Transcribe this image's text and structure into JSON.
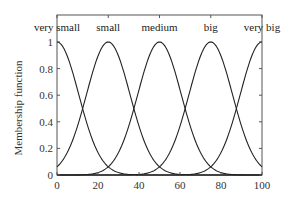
{
  "chart_data": {
    "type": "line",
    "title": "",
    "xlabel": "",
    "ylabel": "Membership function",
    "xlim": [
      0,
      100
    ],
    "ylim": [
      0,
      1.0
    ],
    "grid": false,
    "legend": "none",
    "x_ticks": [
      0,
      20,
      40,
      60,
      80,
      100
    ],
    "y_ticks": [
      0,
      0.2,
      0.4,
      0.6,
      0.8,
      1
    ],
    "x_tick_labels": [
      "0",
      "20",
      "40",
      "60",
      "80",
      "100"
    ],
    "y_tick_labels": [
      "0",
      "0.2",
      "0.4",
      "0.6",
      "0.8",
      "1"
    ],
    "top_ticks": [
      0,
      25,
      50,
      75,
      100
    ],
    "series": [
      {
        "name": "very small",
        "shape": "gaussian",
        "center": 0,
        "sigma": 10.6
      },
      {
        "name": "small",
        "shape": "gaussian",
        "center": 25,
        "sigma": 10.6
      },
      {
        "name": "medium",
        "shape": "gaussian",
        "center": 50,
        "sigma": 10.6
      },
      {
        "name": "big",
        "shape": "gaussian",
        "center": 75,
        "sigma": 10.6
      },
      {
        "name": "very big",
        "shape": "gaussian",
        "center": 100,
        "sigma": 10.6
      }
    ],
    "annotations": [
      "very small",
      "small",
      "medium",
      "big",
      "very big"
    ],
    "line_color": "#222222",
    "axis_color": "#555555"
  }
}
